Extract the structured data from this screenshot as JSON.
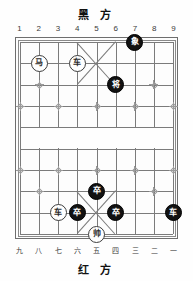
{
  "board": {
    "title_black": "黑 方",
    "title_red": "红 方",
    "files_top": [
      "1",
      "2",
      "3",
      "4",
      "5",
      "6",
      "7",
      "8",
      "9"
    ],
    "files_bottom": [
      "九",
      "八",
      "七",
      "六",
      "五",
      "四",
      "三",
      "二",
      "一"
    ],
    "columns": 9,
    "rows": 10,
    "colors": {
      "line": "#7b7b7b",
      "frame": "#6e6e6e",
      "marker": "#9a9a9a",
      "red_piece_bg": "#ffffff",
      "red_piece_text": "#2b2b2b",
      "black_piece_bg": "#121212",
      "black_piece_text": "#ffffff",
      "background": "#fefefe"
    }
  },
  "chart_data": {
    "type": "table",
    "xlabel": "file",
    "ylabel": "rank",
    "categories": [
      "1",
      "2",
      "3",
      "4",
      "5",
      "6",
      "7",
      "8",
      "9"
    ],
    "pieces": [
      {
        "glyph": "象",
        "side": "black",
        "file": 7,
        "rank": 0,
        "name": "black-elephant"
      },
      {
        "glyph": "马",
        "side": "red",
        "file": 2,
        "rank": 1,
        "name": "red-horse"
      },
      {
        "glyph": "车",
        "side": "red",
        "file": 4,
        "rank": 1,
        "name": "red-chariot-top"
      },
      {
        "glyph": "将",
        "side": "black",
        "file": 6,
        "rank": 2,
        "name": "black-general"
      },
      {
        "glyph": "卒",
        "side": "black",
        "file": 5,
        "rank": 7,
        "name": "black-pawn-center-upper"
      },
      {
        "glyph": "车",
        "side": "red",
        "file": 3,
        "rank": 8,
        "name": "red-chariot-bottom"
      },
      {
        "glyph": "卒",
        "side": "black",
        "file": 4,
        "rank": 8,
        "name": "black-pawn-left"
      },
      {
        "glyph": "卒",
        "side": "black",
        "file": 6,
        "rank": 8,
        "name": "black-pawn-right"
      },
      {
        "glyph": "车",
        "side": "black",
        "file": 9,
        "rank": 8,
        "name": "black-chariot"
      },
      {
        "glyph": "帅",
        "side": "red",
        "file": 5,
        "rank": 9,
        "name": "red-marshal"
      }
    ],
    "markers": [
      {
        "file": 2,
        "rank": 2
      },
      {
        "file": 8,
        "rank": 2
      },
      {
        "file": 1,
        "rank": 3
      },
      {
        "file": 3,
        "rank": 3
      },
      {
        "file": 5,
        "rank": 3
      },
      {
        "file": 7,
        "rank": 3
      },
      {
        "file": 9,
        "rank": 3
      },
      {
        "file": 1,
        "rank": 6
      },
      {
        "file": 3,
        "rank": 6
      },
      {
        "file": 5,
        "rank": 6
      },
      {
        "file": 7,
        "rank": 6
      },
      {
        "file": 9,
        "rank": 6
      },
      {
        "file": 2,
        "rank": 7
      },
      {
        "file": 8,
        "rank": 7
      }
    ]
  }
}
